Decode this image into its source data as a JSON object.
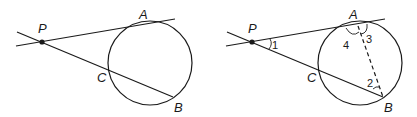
{
  "figures": [
    {
      "name": "left-figure",
      "points": {
        "P": {
          "label": "P"
        },
        "A": {
          "label": "A"
        },
        "B": {
          "label": "B"
        },
        "C": {
          "label": "C"
        }
      }
    },
    {
      "name": "right-figure",
      "points": {
        "P": {
          "label": "P"
        },
        "A": {
          "label": "A"
        },
        "B": {
          "label": "B"
        },
        "C": {
          "label": "C"
        }
      },
      "angles": [
        {
          "label": "1"
        },
        {
          "label": "2"
        },
        {
          "label": "3"
        },
        {
          "label": "4"
        }
      ]
    }
  ],
  "colors": {
    "stroke": "#1a1a1a",
    "background": "#ffffff"
  }
}
